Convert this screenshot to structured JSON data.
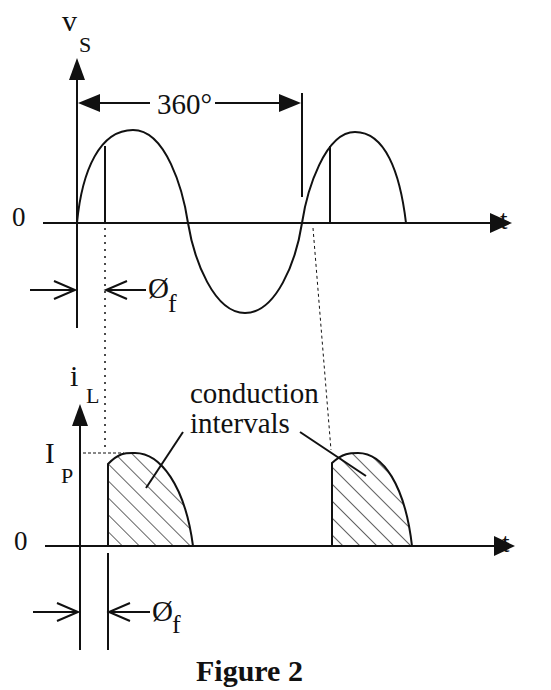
{
  "figure": {
    "caption": "Figure 2",
    "top_plot": {
      "y_label_main": "v",
      "y_label_sub": "S",
      "x_label": "t",
      "zero_label": "0",
      "period_label": "360°",
      "firing_angle_main": "Ø",
      "firing_angle_sub": "f"
    },
    "bottom_plot": {
      "y_label_main": "i",
      "y_label_sub": "L",
      "x_label": "t",
      "zero_label": "0",
      "peak_label_main": "I",
      "peak_label_sub": "P",
      "annotation_line1": "conduction",
      "annotation_line2": "intervals",
      "firing_angle_main": "Ø",
      "firing_angle_sub": "f"
    }
  },
  "colors": {
    "ink": "#111111",
    "background": "#ffffff"
  }
}
